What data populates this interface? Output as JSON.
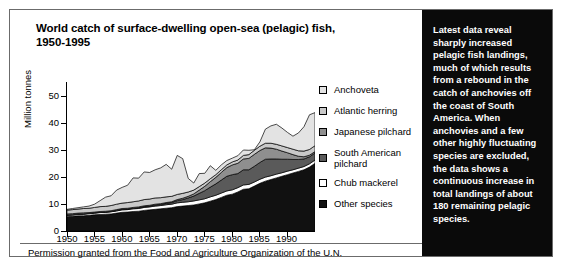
{
  "figure": {
    "title": "World catch of surface-dwelling open-sea (pelagic) fish, 1950-1995",
    "caption": "Permission granted from the Food and Agriculture Organization of the U.N."
  },
  "note_panel": {
    "text": "Latest data reveal sharply increased pelagic fish landings, much of which results from a rebound in the catch of anchovies off the coast of South America. When anchovies and a few other highly fluctuating species are excluded, the data shows a continuous increase in total landings of about 180 remaining pelagic species."
  },
  "legend": {
    "items": [
      {
        "label": "Anchoveta",
        "color": "#e3e3e3"
      },
      {
        "label": "Atlantic herring",
        "color": "#c9c9c9"
      },
      {
        "label": "Japanese pilchard",
        "color": "#8f8f8f"
      },
      {
        "label": "South American pilchard",
        "color": "#5a5a5a"
      },
      {
        "label": "Chub mackerel",
        "color": "#ffffff"
      },
      {
        "label": "Other species",
        "color": "#111111"
      }
    ]
  },
  "axes": {
    "y_ticks": [
      "0",
      "10",
      "20",
      "30",
      "40",
      "50"
    ],
    "x_ticks": [
      "1950",
      "1955",
      "1960",
      "1965",
      "1970",
      "1975",
      "1980",
      "1985",
      "1990"
    ],
    "ylabel": "Million tonnes",
    "xlabel": ""
  },
  "chart_data": {
    "type": "area",
    "title": "World catch of surface-dwelling open-sea (pelagic) fish, 1950-1995",
    "xlabel": "",
    "ylabel": "Million tonnes",
    "xlim": [
      1950,
      1995
    ],
    "ylim": [
      0,
      55
    ],
    "y_ticks": [
      0,
      10,
      20,
      30,
      40,
      50
    ],
    "x_ticks": [
      1950,
      1955,
      1960,
      1965,
      1970,
      1975,
      1980,
      1985,
      1990
    ],
    "grid": false,
    "stacked": true,
    "legend_position": "right",
    "units": "million tonnes",
    "x": [
      1950,
      1951,
      1952,
      1953,
      1954,
      1955,
      1956,
      1957,
      1958,
      1959,
      1960,
      1961,
      1962,
      1963,
      1964,
      1965,
      1966,
      1967,
      1968,
      1969,
      1970,
      1971,
      1972,
      1973,
      1974,
      1975,
      1976,
      1977,
      1978,
      1979,
      1980,
      1981,
      1982,
      1983,
      1984,
      1985,
      1986,
      1987,
      1988,
      1989,
      1990,
      1991,
      1992,
      1993,
      1994,
      1995
    ],
    "series": [
      {
        "name": "Other species",
        "color": "#111111",
        "stack_order": 1,
        "values": [
          5.3,
          5.4,
          5.6,
          5.6,
          5.8,
          6.0,
          6.1,
          6.2,
          6.3,
          6.6,
          6.9,
          7.0,
          7.2,
          7.3,
          7.6,
          7.8,
          8.0,
          8.2,
          8.4,
          8.6,
          9.0,
          9.2,
          9.4,
          9.6,
          10.0,
          10.4,
          11.0,
          11.6,
          12.4,
          13.2,
          13.6,
          14.4,
          15.4,
          15.6,
          16.6,
          17.6,
          18.4,
          19.0,
          19.6,
          20.2,
          20.8,
          21.4,
          22.0,
          22.6,
          23.6,
          25.0
        ]
      },
      {
        "name": "Chub mackerel",
        "color": "#ffffff",
        "stack_order": 2,
        "values": [
          0.5,
          0.5,
          0.5,
          0.6,
          0.6,
          0.6,
          0.7,
          0.7,
          0.8,
          0.8,
          0.9,
          0.9,
          1.0,
          1.0,
          1.1,
          1.1,
          1.2,
          1.2,
          1.3,
          1.3,
          1.4,
          1.4,
          1.4,
          1.5,
          1.5,
          1.5,
          1.6,
          1.6,
          1.6,
          1.6,
          1.6,
          1.6,
          1.6,
          1.6,
          1.5,
          1.5,
          1.5,
          1.4,
          1.4,
          1.3,
          1.3,
          1.2,
          1.2,
          1.2,
          1.2,
          1.2
        ]
      },
      {
        "name": "South American pilchard",
        "color": "#5a5a5a",
        "stack_order": 3,
        "values": [
          0.1,
          0.1,
          0.1,
          0.1,
          0.1,
          0.1,
          0.1,
          0.1,
          0.1,
          0.2,
          0.2,
          0.2,
          0.2,
          0.3,
          0.3,
          0.3,
          0.4,
          0.4,
          0.5,
          0.6,
          0.8,
          1.0,
          1.4,
          1.8,
          2.4,
          3.0,
          3.6,
          4.2,
          4.8,
          5.4,
          5.6,
          5.2,
          5.6,
          5.4,
          5.8,
          6.2,
          6.6,
          6.2,
          5.6,
          5.0,
          4.4,
          3.8,
          3.2,
          2.8,
          2.6,
          2.6
        ]
      },
      {
        "name": "Japanese pilchard",
        "color": "#8f8f8f",
        "stack_order": 4,
        "values": [
          0.4,
          0.4,
          0.4,
          0.4,
          0.3,
          0.3,
          0.3,
          0.3,
          0.3,
          0.3,
          0.3,
          0.3,
          0.3,
          0.3,
          0.3,
          0.3,
          0.3,
          0.3,
          0.3,
          0.3,
          0.4,
          0.5,
          0.6,
          0.8,
          1.2,
          1.6,
          2.0,
          2.4,
          2.8,
          3.2,
          3.6,
          3.8,
          4.0,
          4.2,
          4.4,
          4.4,
          4.2,
          4.0,
          3.6,
          3.0,
          2.4,
          1.8,
          1.2,
          0.8,
          0.6,
          0.5
        ]
      },
      {
        "name": "Atlantic herring",
        "color": "#c9c9c9",
        "stack_order": 5,
        "values": [
          1.4,
          1.5,
          1.5,
          1.6,
          1.6,
          1.7,
          1.8,
          1.8,
          1.9,
          2.0,
          2.0,
          2.1,
          2.1,
          2.2,
          2.3,
          2.3,
          2.3,
          2.2,
          2.1,
          2.0,
          1.9,
          1.8,
          1.6,
          1.4,
          1.3,
          1.2,
          1.1,
          1.0,
          1.0,
          1.0,
          1.1,
          1.2,
          1.3,
          1.4,
          1.5,
          1.6,
          1.7,
          1.8,
          1.8,
          1.9,
          1.9,
          2.0,
          2.0,
          2.1,
          2.1,
          2.2
        ]
      },
      {
        "name": "Anchoveta",
        "color": "#e3e3e3",
        "stack_order": 6,
        "values": [
          0.3,
          0.4,
          0.5,
          0.6,
          0.8,
          1.2,
          2.2,
          3.4,
          3.6,
          5.2,
          5.8,
          6.4,
          8.8,
          8.4,
          10.2,
          9.8,
          10.4,
          11.0,
          12.0,
          10.0,
          14.4,
          12.8,
          5.0,
          2.6,
          4.8,
          3.6,
          4.8,
          1.6,
          1.8,
          1.6,
          1.4,
          1.6,
          2.0,
          1.6,
          0.2,
          1.6,
          5.2,
          6.4,
          7.4,
          6.6,
          5.6,
          4.8,
          6.6,
          9.0,
          12.8,
          12.2
        ]
      }
    ]
  }
}
